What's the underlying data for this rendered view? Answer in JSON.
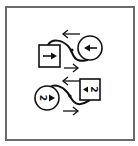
{
  "colors": {
    "frame": "#6a6a6a",
    "ink": "#111111",
    "background": "#ffffff"
  },
  "diagram": {
    "pair_top": {
      "square": {
        "label": "1",
        "arrow": "right"
      },
      "circle": {
        "label": "1",
        "arrow": "left"
      },
      "arrows": [
        "left",
        "right"
      ]
    },
    "pair_bottom": {
      "square": {
        "label": "2",
        "arrow": "left"
      },
      "circle": {
        "label": "2",
        "arrow": "right"
      },
      "arrows": [
        "left",
        "right"
      ]
    }
  }
}
